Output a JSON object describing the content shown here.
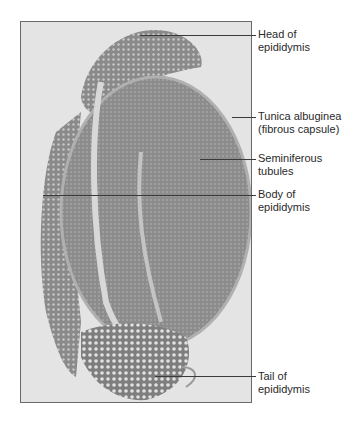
{
  "figure": {
    "labels": [
      {
        "id": "head",
        "line1": "Head of",
        "line2": "epididymis",
        "y": 34,
        "line_from_x": 140
      },
      {
        "id": "tunica",
        "line1": "Tunica albuginea",
        "line2": "(fibrous capsule)",
        "y": 116,
        "line_from_x": 230
      },
      {
        "id": "seminiferous",
        "line1": "Seminiferous",
        "line2": "tubules",
        "y": 158,
        "line_from_x": 200
      },
      {
        "id": "body",
        "line1": "Body of",
        "line2": "epididymis",
        "y": 193,
        "line_from_x": 43
      },
      {
        "id": "tail",
        "line1": "Tail of",
        "line2": "epididymis",
        "y": 376,
        "line_from_x": 155
      }
    ]
  }
}
